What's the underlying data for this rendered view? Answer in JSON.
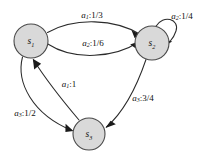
{
  "diagram": {
    "background_color": "#ffffff",
    "node_fill_color": "#d9d9d9",
    "node_stroke_color": "#4a4a4a",
    "edge_color": "#2b2b2b",
    "nodes": [
      {
        "id": "s1",
        "label_base": "s",
        "label_sub": "1",
        "cx": 31,
        "cy": 41,
        "r": 17
      },
      {
        "id": "s2",
        "label_base": "s",
        "label_sub": "2",
        "cx": 152,
        "cy": 43,
        "r": 17
      },
      {
        "id": "s3",
        "label_base": "s",
        "label_sub": "3",
        "cx": 89,
        "cy": 134,
        "r": 16
      }
    ],
    "edges": [
      {
        "id": "e-s1-s2-top",
        "from": "s1",
        "to": "s2",
        "action_base": "a",
        "action_sub": "1",
        "probability": "1/3",
        "label_text": "a1:1/3",
        "label_x": 92,
        "label_y": 15
      },
      {
        "id": "e-s1-s2-bottom",
        "from": "s1",
        "to": "s2",
        "action_base": "a",
        "action_sub": "2",
        "probability": "1/6",
        "label_text": "a2:1/6",
        "label_x": 93,
        "label_y": 43
      },
      {
        "id": "e-s2-s2-self",
        "from": "s2",
        "to": "s2",
        "action_base": "a",
        "action_sub": "2",
        "probability": "1/4",
        "label_text": "a2:1/4",
        "label_x": 182,
        "label_y": 16
      },
      {
        "id": "e-s2-s3",
        "from": "s2",
        "to": "s3",
        "action_base": "a",
        "action_sub": "3",
        "probability": "3/4",
        "label_text": "a3:3/4",
        "label_x": 143,
        "label_y": 98
      },
      {
        "id": "e-s1-s3",
        "from": "s1",
        "to": "s3",
        "action_base": "a",
        "action_sub": "3",
        "probability": "1/2",
        "label_text": "a3:1/2",
        "label_x": 25,
        "label_y": 113
      },
      {
        "id": "e-s3-s1",
        "from": "s3",
        "to": "s1",
        "action_base": "a",
        "action_sub": "1",
        "probability": "1",
        "label_text": "a1:1",
        "label_x": 69,
        "label_y": 84
      }
    ]
  }
}
